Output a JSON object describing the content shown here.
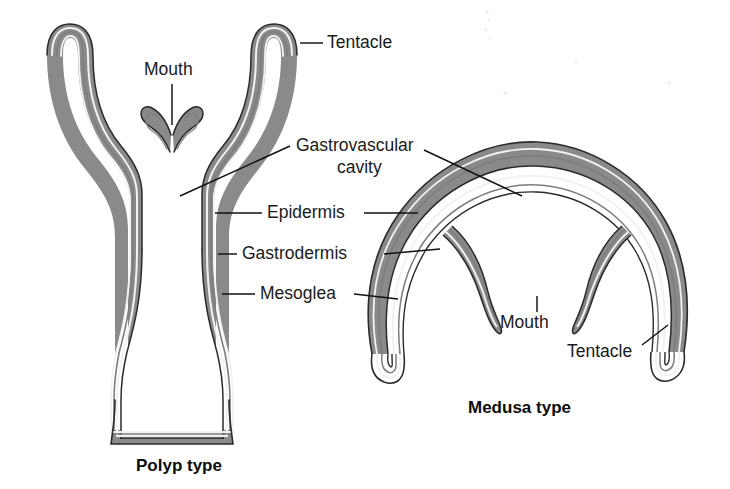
{
  "figure": {
    "title_polyp": "Polyp type",
    "title_medusa": "Medusa type",
    "background_color": "#ffffff",
    "ink_color": "#1c1c1c",
    "mesoglea_color": "#8a8a8a",
    "epidermis_color": "#2b2b2b",
    "gastrodermis_color": "#7d7d7d",
    "cavity_color": "#ffffff"
  },
  "labels": {
    "tentacle_polyp": "Tentacle",
    "mouth_polyp": "Mouth",
    "gastrovascular_cavity_line1": "Gastrovascular",
    "gastrovascular_cavity_line2": "cavity",
    "epidermis": "Epidermis",
    "gastrodermis": "Gastrodermis",
    "mesoglea": "Mesoglea",
    "mouth_medusa": "Mouth",
    "tentacle_medusa": "Tentacle"
  },
  "structures": [
    {
      "name": "tentacle",
      "label": "Tentacle",
      "appears_in": [
        "polyp",
        "medusa"
      ]
    },
    {
      "name": "mouth",
      "label": "Mouth",
      "appears_in": [
        "polyp",
        "medusa"
      ]
    },
    {
      "name": "gastrovascular-cavity",
      "label": "Gastrovascular cavity",
      "appears_in": [
        "polyp",
        "medusa"
      ]
    },
    {
      "name": "epidermis",
      "label": "Epidermis",
      "appears_in": [
        "polyp",
        "medusa"
      ]
    },
    {
      "name": "gastrodermis",
      "label": "Gastrodermis",
      "appears_in": [
        "polyp",
        "medusa"
      ]
    },
    {
      "name": "mesoglea",
      "label": "Mesoglea",
      "appears_in": [
        "polyp",
        "medusa"
      ]
    }
  ]
}
